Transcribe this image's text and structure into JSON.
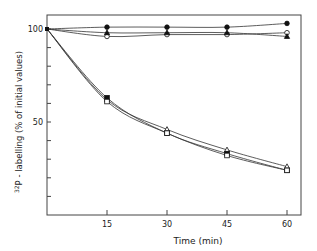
{
  "chart_data": {
    "type": "line",
    "title": "",
    "xlabel": "Time  (min)",
    "ylabel": "32P - labelling  (% of initial values)",
    "xlim": [
      0,
      62
    ],
    "ylim": [
      0,
      105
    ],
    "x_ticks": [
      15,
      30,
      45,
      60
    ],
    "y_tick_labels": [
      50,
      100
    ],
    "x": [
      0,
      15,
      30,
      45,
      60
    ],
    "series": [
      {
        "name": "filled circle",
        "marker": "filled-circle",
        "values": [
          100,
          101,
          101,
          101,
          103
        ]
      },
      {
        "name": "open circle",
        "marker": "open-circle",
        "values": [
          100,
          96,
          97,
          97,
          98
        ]
      },
      {
        "name": "filled triangle",
        "marker": "filled-triangle",
        "values": [
          100,
          98,
          98,
          98,
          96
        ]
      },
      {
        "name": "open triangle",
        "marker": "open-triangle",
        "values": [
          100,
          62,
          46,
          35,
          26
        ]
      },
      {
        "name": "filled square",
        "marker": "filled-square",
        "values": [
          100,
          63,
          44,
          33,
          24
        ]
      },
      {
        "name": "open square",
        "marker": "open-square",
        "values": [
          100,
          61,
          44,
          32,
          24
        ]
      }
    ]
  },
  "labels": {
    "x_axis": "Time  (min)",
    "y_axis": "32P - labelling  (% of initial values)",
    "y_sup": "32",
    "y_main": "P - labelling  (% of initial values)"
  }
}
